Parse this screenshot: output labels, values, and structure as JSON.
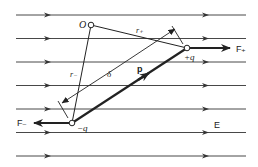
{
  "diagram": {
    "field_label": "E",
    "field_line_count": 7,
    "labels": {
      "origin": "O",
      "r_plus": "r₊",
      "r_minus": "r₋",
      "separation": "δ",
      "dipole_moment": "p",
      "positive_charge": "+q",
      "negative_charge": "−q",
      "force_plus": "F₊",
      "force_minus": "F₋"
    },
    "colors": {
      "ink": "#222222",
      "field_line": "#333333",
      "background": "#ffffff"
    }
  }
}
